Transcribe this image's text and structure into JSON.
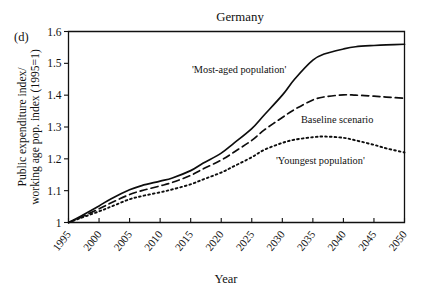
{
  "figure": {
    "panel_label": "(d)",
    "title": "Germany"
  },
  "chart_data": {
    "type": "line",
    "title": "Germany",
    "xlabel": "Year",
    "ylabel": "Public expenditure index/ working age pop. index (1995=1)",
    "ylabel_line1": "Public expenditure index/",
    "ylabel_line2": "working age pop. index (1995=1)",
    "xlim": [
      1995,
      2050
    ],
    "ylim": [
      1.0,
      1.6
    ],
    "grid": false,
    "legend_position": "inline-annotations",
    "xticks": [
      1995,
      2000,
      2005,
      2010,
      2015,
      2020,
      2025,
      2030,
      2035,
      2040,
      2045,
      2050
    ],
    "xtick_labels": [
      "1995",
      "2000",
      "2005",
      "2010",
      "2015",
      "2020",
      "2025",
      "2030",
      "2035",
      "2040",
      "2045",
      "2050"
    ],
    "yticks": [
      1,
      1.1,
      1.2,
      1.3,
      1.4,
      1.5,
      1.6
    ],
    "ytick_labels": [
      "1",
      "1.1",
      "1.2",
      "1.3",
      "1.4",
      "1.5",
      "1.6"
    ],
    "x": [
      1995,
      1997,
      2000,
      2002,
      2005,
      2007,
      2010,
      2012,
      2015,
      2017,
      2020,
      2022,
      2025,
      2027,
      2030,
      2032,
      2035,
      2037,
      2040,
      2042,
      2045,
      2047,
      2050
    ],
    "series": [
      {
        "name": "'Most-aged population'",
        "style": "solid",
        "annotation": "'Most-aged population'",
        "values": [
          1.0,
          1.02,
          1.052,
          1.075,
          1.103,
          1.116,
          1.13,
          1.14,
          1.163,
          1.186,
          1.218,
          1.248,
          1.295,
          1.337,
          1.4,
          1.45,
          1.51,
          1.53,
          1.545,
          1.552,
          1.556,
          1.558,
          1.56
        ]
      },
      {
        "name": "Baseline scenario",
        "style": "dashed",
        "annotation": "Baseline scenario",
        "values": [
          1.0,
          1.016,
          1.043,
          1.062,
          1.088,
          1.1,
          1.115,
          1.126,
          1.148,
          1.168,
          1.196,
          1.22,
          1.258,
          1.29,
          1.33,
          1.355,
          1.385,
          1.395,
          1.401,
          1.4,
          1.397,
          1.394,
          1.39
        ]
      },
      {
        "name": "'Youngest population'",
        "style": "dotted",
        "annotation": "'Youngest population'",
        "values": [
          1.0,
          1.014,
          1.035,
          1.05,
          1.073,
          1.083,
          1.095,
          1.104,
          1.12,
          1.135,
          1.157,
          1.176,
          1.205,
          1.228,
          1.25,
          1.26,
          1.268,
          1.27,
          1.266,
          1.258,
          1.244,
          1.233,
          1.22
        ]
      }
    ],
    "annotations": [
      {
        "text": "'Most-aged population'",
        "x_px": 192,
        "y_px": 73
      },
      {
        "text": "Baseline scenario",
        "x_px": 301,
        "y_px": 123
      },
      {
        "text": "'Youngest population'",
        "x_px": 276,
        "y_px": 164
      }
    ]
  }
}
